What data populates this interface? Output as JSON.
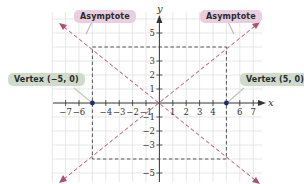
{
  "diagram": {
    "axes": {
      "x_label": "x",
      "y_label": "y",
      "x_ticks": [
        "-7",
        "-6",
        "-4",
        "-3",
        "-2",
        "-1",
        "1",
        "2",
        "3",
        "4",
        "6",
        "7"
      ],
      "y_ticks": [
        "5",
        "3",
        "2",
        "1",
        "-1",
        "-2",
        "-3",
        "-5"
      ]
    },
    "labels": {
      "asymptote_left": "Asymptote",
      "asymptote_right": "Asymptote",
      "vertex_left": "Vertex (−5, 0)",
      "vertex_right": "Vertex (5, 0)"
    },
    "vertices": [
      {
        "x": -5,
        "y": 0
      },
      {
        "x": 5,
        "y": 0
      }
    ],
    "central_box": {
      "x": [
        -5,
        5
      ],
      "y": [
        -4,
        4
      ]
    },
    "asymptotes": [
      "y = 4/5 x",
      "y = -4/5 x"
    ],
    "colors": {
      "asymptote": "#b0506e",
      "vertex_point": "#1f2d6b",
      "grid": "#dcdcdc",
      "axis": "#333333",
      "asymptote_callout": "#e8cfe0",
      "vertex_callout": "#cfdccd"
    }
  }
}
